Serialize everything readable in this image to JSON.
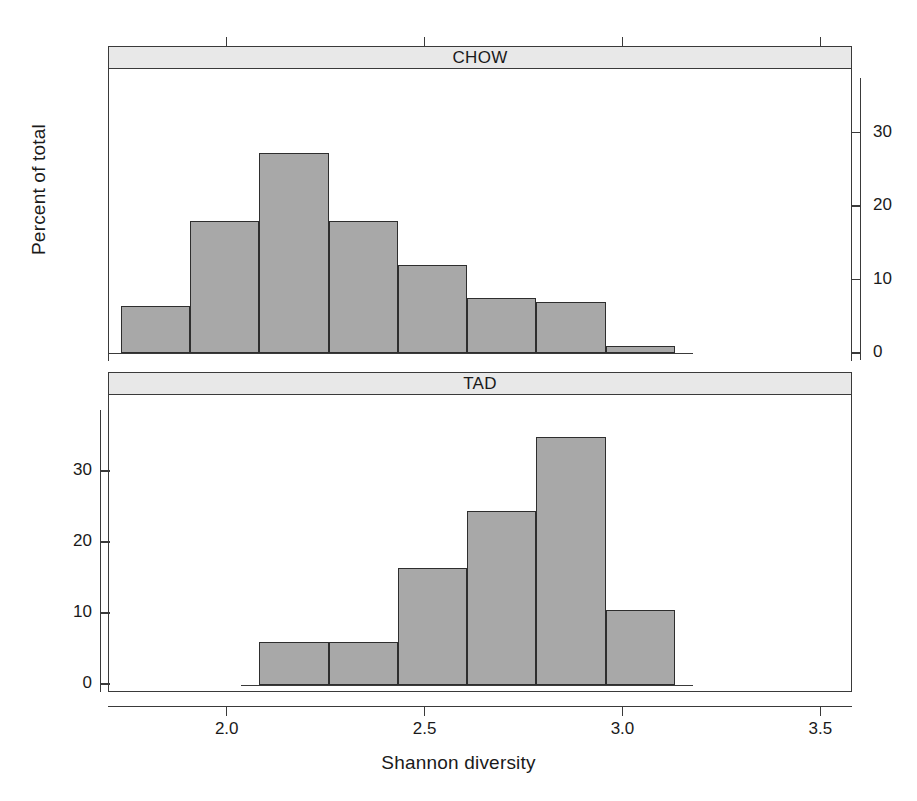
{
  "chart_data": {
    "type": "bar",
    "title": "",
    "xlabel": "Shannon diversity",
    "ylabel": "Percent of total",
    "xlim": [
      1.7,
      3.58
    ],
    "ylim": [
      0,
      38
    ],
    "grid": false,
    "legend": "none",
    "layout": "two stacked histogram panels sharing the x axis; CHOW panel y-axis ticks on the right, TAD panel y-axis ticks on the left",
    "xticks": [
      2.0,
      2.5,
      3.0,
      3.5
    ],
    "xticklabels": [
      "2.0",
      "2.5",
      "3.0",
      "3.5"
    ],
    "panels": [
      {
        "name": "CHOW",
        "strip_label": "CHOW",
        "axis_side": "right",
        "yticks": [
          0,
          10,
          20,
          30
        ],
        "yticklabels": [
          "0",
          "10",
          "20",
          "30"
        ],
        "bin_width": 0.175,
        "bins": [
          {
            "x0": 1.73,
            "x1": 1.905,
            "value": 6.4
          },
          {
            "x0": 1.905,
            "x1": 2.08,
            "value": 18.0
          },
          {
            "x0": 2.08,
            "x1": 2.255,
            "value": 27.2
          },
          {
            "x0": 2.255,
            "x1": 2.43,
            "value": 18.0
          },
          {
            "x0": 2.43,
            "x1": 2.605,
            "value": 12.0
          },
          {
            "x0": 2.605,
            "x1": 2.78,
            "value": 7.5
          },
          {
            "x0": 2.78,
            "x1": 2.955,
            "value": 7.0
          },
          {
            "x0": 2.955,
            "x1": 3.13,
            "value": 1.0
          }
        ]
      },
      {
        "name": "TAD",
        "strip_label": "TAD",
        "axis_side": "left",
        "yticks": [
          0,
          10,
          20,
          30
        ],
        "yticklabels": [
          "0",
          "10",
          "20",
          "30"
        ],
        "bin_width": 0.175,
        "bins": [
          {
            "x0": 2.08,
            "x1": 2.255,
            "value": 6.0
          },
          {
            "x0": 2.255,
            "x1": 2.43,
            "value": 6.0
          },
          {
            "x0": 2.43,
            "x1": 2.605,
            "value": 16.5
          },
          {
            "x0": 2.605,
            "x1": 2.78,
            "value": 24.5
          },
          {
            "x0": 2.78,
            "x1": 2.955,
            "value": 35.0
          },
          {
            "x0": 2.955,
            "x1": 3.13,
            "value": 10.5
          }
        ]
      }
    ],
    "colors": {
      "bar_fill": "#a8a8a8",
      "bar_stroke": "#2e2e2e",
      "strip_fill": "#e8e8e8",
      "axis": "#3a3a3a",
      "background": "#ffffff",
      "text": "#1a1a1a"
    }
  }
}
